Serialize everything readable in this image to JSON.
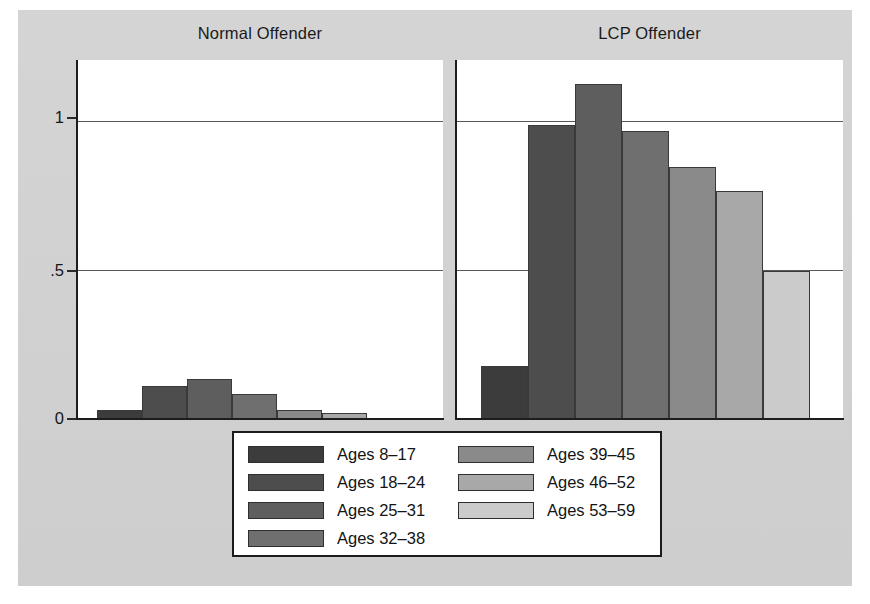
{
  "chart_data": {
    "type": "bar",
    "title": "",
    "panels": [
      {
        "title": "Normal Offender",
        "categories": [
          "Ages 8–17",
          "Ages 18–24",
          "Ages 25–31",
          "Ages 32–38",
          "Ages 39–45",
          "Ages 46–52",
          "Ages 53–59"
        ],
        "values": [
          0.03,
          0.11,
          0.135,
          0.085,
          0.03,
          0.02,
          0.0
        ]
      },
      {
        "title": "LCP Offender",
        "categories": [
          "Ages 8–17",
          "Ages 18–24",
          "Ages 25–31",
          "Ages 32–38",
          "Ages 39–45",
          "Ages 46–52",
          "Ages 53–59"
        ],
        "values": [
          0.18,
          0.99,
          1.13,
          0.97,
          0.85,
          0.77,
          0.5
        ]
      }
    ],
    "xlabel": "",
    "ylabel": "",
    "ylim": [
      0,
      1.21
    ],
    "yticks": [
      0,
      0.5,
      1
    ],
    "ytick_labels": [
      "0",
      ".5",
      "1"
    ],
    "grid": true,
    "grid_axis": "y",
    "legend_position": "bottom-center",
    "series_colors": [
      "#3c3c3c",
      "#4d4d4d",
      "#5e5e5e",
      "#6f6f6f",
      "#8a8a8a",
      "#a8a8a8",
      "#cbcbcb"
    ]
  },
  "panel_titles": {
    "left": "Normal Offender",
    "right": "LCP Offender"
  },
  "axis": {
    "y_tick_1": "1",
    "y_tick_half": ".5",
    "y_tick_zero": "0"
  },
  "legend": {
    "column_left": [
      {
        "label": "Ages 8–17",
        "color": "#3c3c3c"
      },
      {
        "label": "Ages 18–24",
        "color": "#4d4d4d"
      },
      {
        "label": "Ages 25–31",
        "color": "#5e5e5e"
      },
      {
        "label": "Ages 32–38",
        "color": "#6f6f6f"
      }
    ],
    "column_right": [
      {
        "label": "Ages 39–45",
        "color": "#8a8a8a"
      },
      {
        "label": "Ages 46–52",
        "color": "#a8a8a8"
      },
      {
        "label": "Ages 53–59",
        "color": "#cbcbcb"
      }
    ]
  },
  "colors": {
    "plate_background": "#d2d2d2",
    "panel_background": "#ffffff",
    "axis": "#1d1d1d",
    "gridline": "#55585c"
  }
}
